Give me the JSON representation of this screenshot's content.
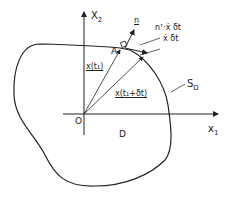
{
  "diagram": {
    "axes": {
      "x1_label": "x",
      "x1_sub": "1",
      "x2_label": "X",
      "x2_sub": "2",
      "origin_label": "O"
    },
    "region_label": "D",
    "boundary_label": "S",
    "boundary_sub": "D",
    "point_label": "A",
    "vectors": {
      "x_t1": "x(t₁)",
      "x_t1_dt": "x(t₁+δt)",
      "normal": "n",
      "normal_proj": "nᵀ·ẋ δt",
      "velocity_step": "ẋ δt"
    }
  }
}
